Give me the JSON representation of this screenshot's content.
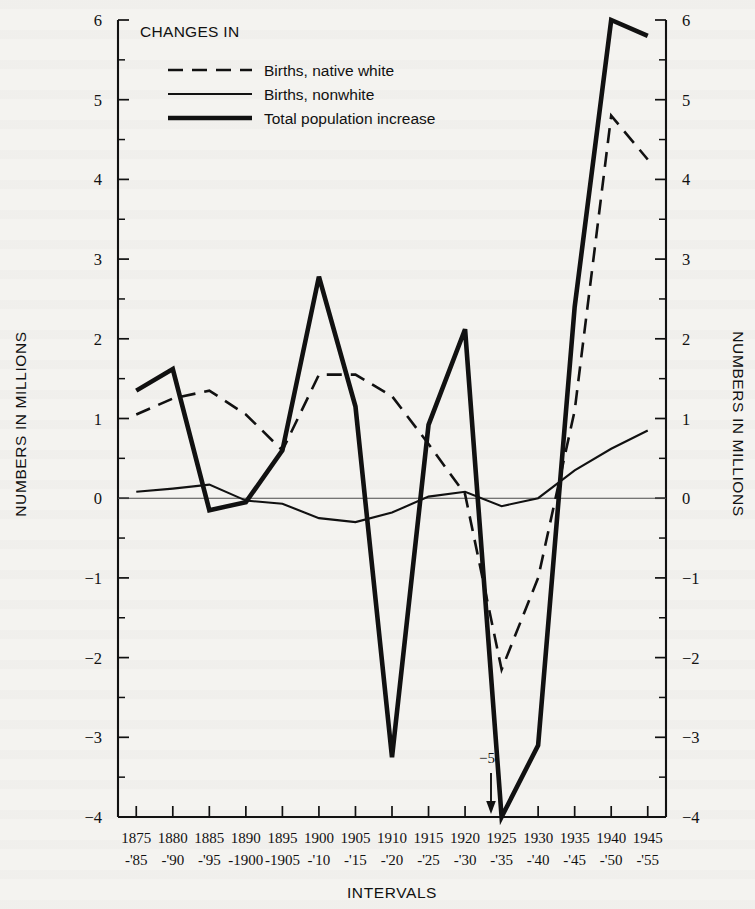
{
  "figure": {
    "legend_title": "CHANGES IN",
    "y_axis_label_left": "NUMBERS IN MILLIONS",
    "y_axis_label_right": "NUMBERS IN MILLIONS",
    "x_axis_label": "INTERVALS",
    "annotation": {
      "text": "−5",
      "icon": "down-arrow-icon"
    }
  },
  "chart_data": {
    "type": "line",
    "title": "CHANGES IN",
    "xlabel": "INTERVALS",
    "ylabel": "NUMBERS IN MILLIONS",
    "ylim": [
      -4,
      6
    ],
    "ytick_labels": [
      "6",
      "5",
      "4",
      "3",
      "2",
      "1",
      "0",
      "−1",
      "−2",
      "−3",
      "−4"
    ],
    "ytick_values": [
      6,
      5,
      4,
      3,
      2,
      1,
      0,
      -1,
      -2,
      -3,
      -4
    ],
    "y_minor_step": 0.5,
    "grid": false,
    "legend_position": "upper-left",
    "categories": [
      "1875-'85",
      "1880-'90",
      "1885-'95",
      "1890-1900",
      "1895-1905",
      "1900-'10",
      "1905-'15",
      "1910-'20",
      "1915-'25",
      "1920-'30",
      "1925-'35",
      "1930-'40",
      "1935-'45",
      "1940-'50",
      "1945-'55"
    ],
    "xtick_labels_top": [
      "1875",
      "1880",
      "1885",
      "1890",
      "1895",
      "1900",
      "1905",
      "1910",
      "1915",
      "1920",
      "1925",
      "1930",
      "1935",
      "1940",
      "1945"
    ],
    "xtick_labels_bottom": [
      "-'85",
      "-'90",
      "-'95",
      "-1900",
      "-1905",
      "-'10",
      "-'15",
      "-'20",
      "-'25",
      "-'30",
      "-'35",
      "-'40",
      "-'45",
      "-'50",
      "-'55"
    ],
    "series": [
      {
        "name": "Births, native white",
        "key": "native",
        "style": "dashed",
        "values": [
          1.05,
          1.25,
          1.35,
          1.05,
          0.6,
          1.55,
          1.55,
          1.28,
          0.68,
          0.05,
          -2.15,
          -1.0,
          1.1,
          4.8,
          4.25
        ]
      },
      {
        "name": "Births, nonwhite",
        "key": "nonwhite",
        "style": "thin-solid",
        "values": [
          0.08,
          0.12,
          0.17,
          -0.03,
          -0.07,
          -0.25,
          -0.3,
          -0.18,
          0.02,
          0.08,
          -0.1,
          0.0,
          0.35,
          0.62,
          0.85
        ]
      },
      {
        "name": "Total population increase",
        "key": "total",
        "style": "thick-solid",
        "values": [
          1.35,
          1.62,
          -0.15,
          -0.05,
          0.6,
          2.78,
          1.15,
          -3.25,
          0.92,
          2.12,
          -5.0,
          -3.1,
          2.4,
          6.0,
          5.8
        ],
        "note": "value at 1925-'35 is −5, plotted off the −4 axis limit and marked by an arrow annotation"
      }
    ],
    "annotations": [
      {
        "text": "−5",
        "at_category": "1925-'35",
        "value": -5,
        "marker": "down-arrow"
      }
    ]
  }
}
